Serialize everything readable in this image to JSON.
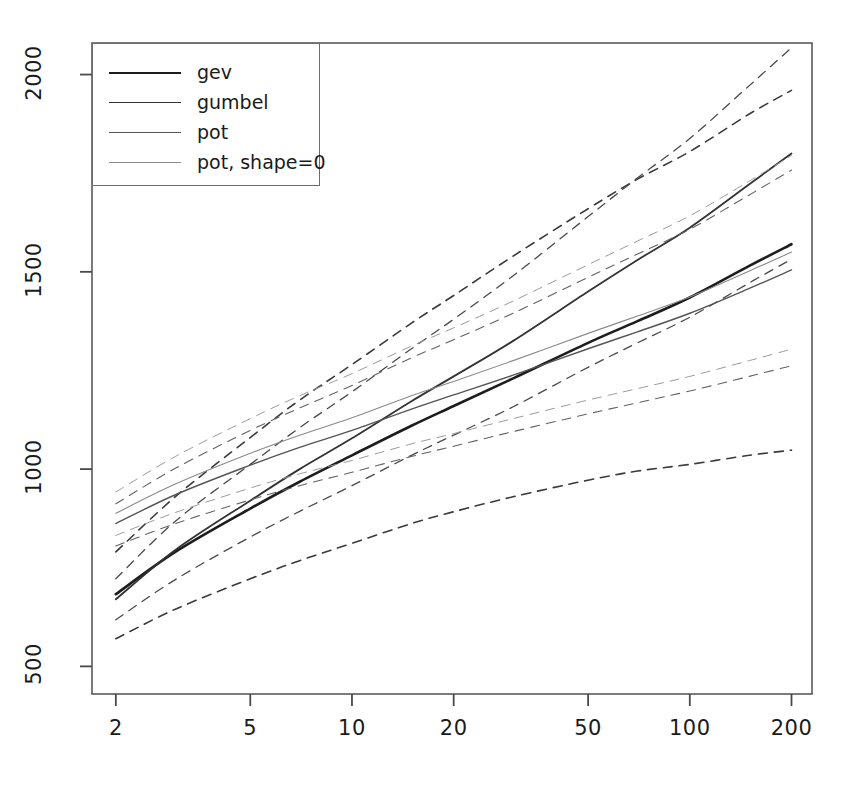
{
  "chart_data": {
    "type": "line",
    "title": "",
    "subtitle": "",
    "xlabel": "",
    "ylabel": "",
    "xscale": "log",
    "yscale": "linear",
    "grid": false,
    "legend_position": "top-left",
    "xlim": [
      1.7,
      230
    ],
    "ylim": [
      430,
      2080
    ],
    "x_ticks": [
      2,
      5,
      10,
      20,
      50,
      100,
      200
    ],
    "x_tick_labels": [
      "2",
      "5",
      "10",
      "20",
      "50",
      "100",
      "200"
    ],
    "y_ticks": [
      500,
      1000,
      1500,
      2000
    ],
    "y_tick_labels": [
      "500",
      "1000",
      "1500",
      "2000"
    ],
    "x": [
      2,
      3,
      5,
      7,
      10,
      15,
      20,
      30,
      50,
      70,
      100,
      150,
      200
    ],
    "series": [
      {
        "name": "gev",
        "style": "solid",
        "color": "#1d1d1d",
        "width": 2.6,
        "values": [
          683,
          790,
          900,
          968,
          1035,
          1110,
          1160,
          1230,
          1320,
          1375,
          1435,
          1515,
          1570
        ]
      },
      {
        "name": "gev-lower-ci",
        "style": "dashed",
        "color": "#3a3a3a",
        "width": 1.6,
        "parent": "gev",
        "values": [
          570,
          645,
          722,
          768,
          812,
          862,
          892,
          930,
          972,
          995,
          1012,
          1035,
          1048
        ]
      },
      {
        "name": "gev-upper-ci",
        "style": "dashed",
        "color": "#3a3a3a",
        "width": 1.6,
        "parent": "gev",
        "values": [
          790,
          930,
          1080,
          1175,
          1265,
          1370,
          1440,
          1540,
          1660,
          1735,
          1805,
          1900,
          1960
        ]
      },
      {
        "name": "gumbel",
        "style": "solid",
        "color": "#333333",
        "width": 1.8,
        "values": [
          670,
          795,
          920,
          1000,
          1078,
          1172,
          1235,
          1325,
          1450,
          1530,
          1612,
          1722,
          1800
        ]
      },
      {
        "name": "gumbel-lower-ci",
        "style": "dashed",
        "color": "#4a4a4a",
        "width": 1.3,
        "parent": "gumbel",
        "values": [
          618,
          720,
          828,
          893,
          958,
          1035,
          1086,
          1158,
          1258,
          1320,
          1385,
          1472,
          1532
        ]
      },
      {
        "name": "gumbel-upper-ci",
        "style": "dashed",
        "color": "#4a4a4a",
        "width": 1.3,
        "parent": "gumbel",
        "values": [
          722,
          868,
          1012,
          1105,
          1196,
          1305,
          1380,
          1490,
          1640,
          1738,
          1838,
          1972,
          2068
        ]
      },
      {
        "name": "pot",
        "style": "solid",
        "color": "#555555",
        "width": 1.4,
        "values": [
          862,
          935,
          1010,
          1055,
          1098,
          1152,
          1188,
          1238,
          1305,
          1348,
          1395,
          1458,
          1505
        ]
      },
      {
        "name": "pot-lower-ci",
        "style": "dashed",
        "color": "#626262",
        "width": 1.1,
        "parent": "pot",
        "values": [
          805,
          862,
          922,
          958,
          992,
          1032,
          1058,
          1095,
          1140,
          1168,
          1198,
          1235,
          1262
        ]
      },
      {
        "name": "pot-upper-ci",
        "style": "dashed",
        "color": "#626262",
        "width": 1.1,
        "parent": "pot",
        "values": [
          912,
          1002,
          1098,
          1155,
          1212,
          1282,
          1328,
          1395,
          1486,
          1545,
          1608,
          1695,
          1758
        ]
      },
      {
        "name": "pot, shape=0",
        "style": "solid",
        "color": "#8a8a8a",
        "width": 1.1,
        "values": [
          888,
          962,
          1040,
          1086,
          1130,
          1186,
          1222,
          1275,
          1344,
          1388,
          1436,
          1502,
          1550
        ]
      },
      {
        "name": "pot-shape0-lower-ci",
        "style": "dashed",
        "color": "#9a9a9a",
        "width": 1.0,
        "parent": "pot, shape=0",
        "values": [
          832,
          890,
          952,
          988,
          1022,
          1064,
          1090,
          1128,
          1175,
          1204,
          1235,
          1275,
          1304
        ]
      },
      {
        "name": "pot-shape0-upper-ci",
        "style": "dashed",
        "color": "#9a9a9a",
        "width": 1.0,
        "parent": "pot, shape=0",
        "values": [
          942,
          1032,
          1128,
          1186,
          1242,
          1312,
          1358,
          1426,
          1518,
          1578,
          1642,
          1730,
          1795
        ]
      }
    ]
  },
  "legend": {
    "entries": [
      {
        "label": "gev",
        "style": "solid",
        "color": "#1d1d1d",
        "width": 2.6
      },
      {
        "label": "gumbel",
        "style": "solid",
        "color": "#333333",
        "width": 1.8
      },
      {
        "label": "pot",
        "style": "solid",
        "color": "#555555",
        "width": 1.3
      },
      {
        "label": "pot, shape=0",
        "style": "solid",
        "color": "#8a8a8a",
        "width": 1.0
      }
    ]
  },
  "axes": {
    "frame_color": "#5a5a5a",
    "tick_color": "#4a4a4a",
    "label_color": "#1a1a1a"
  }
}
